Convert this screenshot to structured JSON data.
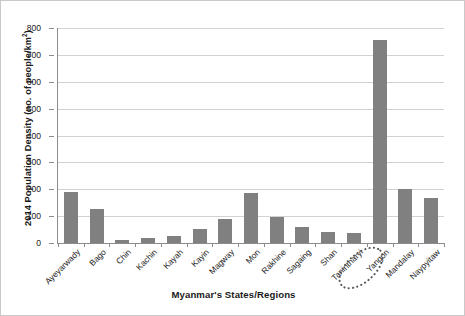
{
  "chart_data": {
    "type": "bar",
    "title": "",
    "xlabel": "Myanmar's States/Regions",
    "ylabel_prefix": "2014 Population Density ",
    "ylabel_paren": "(no. of people/km",
    "ylabel_sup": "2",
    "ylabel_close": ")",
    "ylabel_full": "2014 Population Density (no. of people/km2)",
    "categories": [
      "Ayeyarwady",
      "Bago",
      "Chin",
      "Kachin",
      "Kayah",
      "Kayin",
      "Magway",
      "Mon",
      "Rakhine",
      "Sagaing",
      "Shan",
      "Tanintharyi",
      "Yangon",
      "Mandalay",
      "Naypyitaw"
    ],
    "values": [
      190,
      128,
      13,
      19,
      26,
      54,
      90,
      186,
      95,
      58,
      41,
      38,
      755,
      202,
      168
    ],
    "ylim": [
      0,
      800
    ],
    "yticks": [
      0,
      100,
      200,
      300,
      400,
      500,
      600,
      700,
      800
    ],
    "ytick_labels": [
      "0",
      "100",
      "200",
      "300",
      "400",
      "500",
      "600",
      "700",
      "800"
    ],
    "grid": true,
    "legend": "none",
    "bar_color": "#808080",
    "gridline_color": "#d2d2d2",
    "axis_color": "#8c8c8c",
    "annotations": [
      {
        "name": "yangon-highlight",
        "shape": "dotted-ellipse",
        "target": "Yangon",
        "color": "#555555"
      }
    ]
  }
}
